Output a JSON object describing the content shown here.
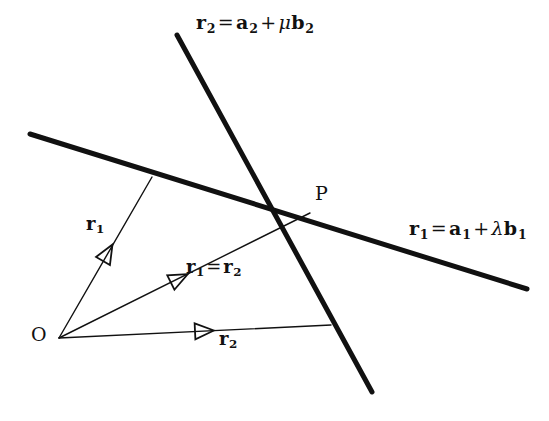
{
  "figure": {
    "background": "#ffffff",
    "ink": "#111111",
    "width": 549,
    "height": 421
  },
  "labels": {
    "line2_equation": {
      "r": "r",
      "r_sub": "2",
      "eq": "=",
      "a": "a",
      "a_sub": "2",
      "plus": "+",
      "greek": "μ",
      "b": "b",
      "b_sub": "2"
    },
    "line1_equation": {
      "r": "r",
      "r_sub": "1",
      "eq": "=",
      "a": "a",
      "a_sub": "1",
      "plus": "+",
      "greek": "λ",
      "b": "b",
      "b_sub": "1"
    },
    "point_P": "P",
    "origin_O": "O",
    "vector_r1": {
      "sym": "r",
      "sub": "1"
    },
    "vector_r1_eq_r2": {
      "sym1": "r",
      "sub1": "1",
      "eq": "=",
      "sym2": "r",
      "sub2": "2"
    },
    "vector_r2": {
      "sym": "r",
      "sub": "2"
    }
  },
  "geometry": {
    "thick_line_width": 5,
    "thin_line_width": 1.4,
    "arrowhead_style": "open-triangle",
    "line1": {
      "name": "line-r1",
      "x1": 30,
      "y1": 134,
      "x2": 527,
      "y2": 289
    },
    "line2": {
      "name": "line-r2",
      "x1": 177,
      "y1": 35,
      "x2": 372,
      "y2": 392
    },
    "point_P": {
      "x": 310,
      "y": 213
    },
    "origin_O": {
      "x": 59,
      "y": 338
    },
    "ray_r1": {
      "x1": 59,
      "y1": 338,
      "x2": 152,
      "y2": 177
    },
    "ray_r1_eq_r2": {
      "x1": 59,
      "y1": 338,
      "x2": 310,
      "y2": 213
    },
    "ray_r2": {
      "x1": 59,
      "y1": 338,
      "x2": 331,
      "y2": 325
    },
    "arrow_r1": {
      "x": 107,
      "y": 254,
      "angle": -60
    },
    "arrow_r1_eq_r2": {
      "x": 178,
      "y": 279,
      "angle": -26.5
    },
    "arrow_r2": {
      "x": 203,
      "y": 331,
      "angle": -2.7
    }
  }
}
